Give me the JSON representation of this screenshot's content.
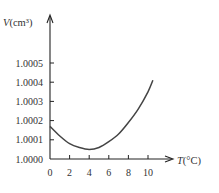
{
  "chart_data": {
    "type": "line",
    "title": "",
    "xlabel": "T(°C)",
    "ylabel": "V(cm³)",
    "xlabel_italic_part": "T",
    "xlabel_unit": "(°C)",
    "ylabel_italic_part": "V",
    "ylabel_unit": "(cm³)",
    "x_ticks": [
      "0",
      "2",
      "4",
      "6",
      "8",
      "10"
    ],
    "y_ticks": [
      "1.0000",
      "1.0001",
      "1.0002",
      "1.0003",
      "1.0004",
      "1.0005"
    ],
    "xlim": [
      0,
      11
    ],
    "ylim": [
      1.0,
      1.0006
    ],
    "grid": false,
    "legend": null,
    "series": [
      {
        "name": "Volume of water vs temperature",
        "x": [
          0,
          1,
          2,
          3,
          4,
          5,
          6,
          7,
          8,
          9,
          10,
          10.5
        ],
        "y": [
          1.00017,
          1.00012,
          1.00008,
          1.00006,
          1.00005,
          1.00006,
          1.00009,
          1.00013,
          1.00019,
          1.00026,
          1.00035,
          1.00041
        ]
      }
    ],
    "colors": {
      "axis": "#222222",
      "curve": "#444444",
      "text": "#333333"
    }
  }
}
